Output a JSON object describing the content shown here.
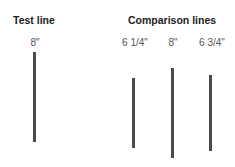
{
  "headings": {
    "test": "Test line",
    "comparison": "Comparison lines"
  },
  "test_line": {
    "label": "8\"",
    "x": 34,
    "y1": 52,
    "y2": 142
  },
  "comparison_lines": [
    {
      "label": "6 1/4\"",
      "x": 133,
      "y1": 78,
      "y2": 148
    },
    {
      "label": "8\"",
      "x": 172,
      "y1": 68,
      "y2": 158
    },
    {
      "label": "6 3/4\"",
      "x": 210,
      "y1": 75,
      "y2": 151
    }
  ]
}
